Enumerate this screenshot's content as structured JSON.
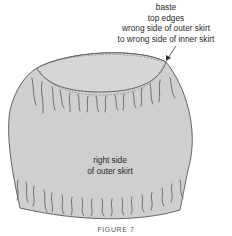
{
  "callout": {
    "lines": [
      "baste",
      "top edges",
      "wrong side of outer skirt",
      "to wrong side of inner skirt"
    ]
  },
  "body_label": {
    "lines": [
      "right side",
      "of outer skirt"
    ]
  },
  "caption": "FIGURE 7",
  "colors": {
    "fabric": "#cfcfcf",
    "inner": "#d6d6d6",
    "outline": "#555555",
    "text": "#2a2a2a"
  }
}
